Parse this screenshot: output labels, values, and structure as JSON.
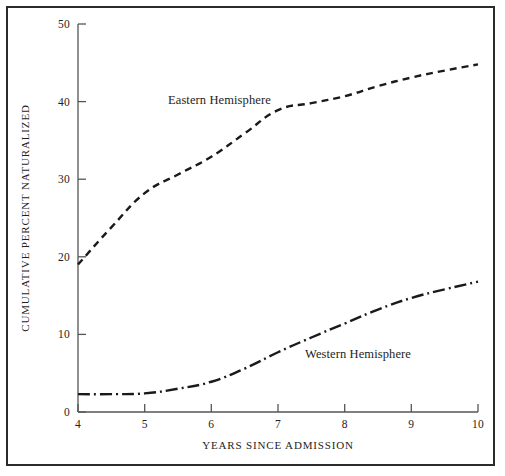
{
  "figure": {
    "background_color": "#ffffff",
    "frame_color": "#2b2b2b",
    "line_color": "#1a1a1a"
  },
  "axes": {
    "x_title": "YEARS SINCE ADMISSION",
    "y_title": "CUMULATIVE PERCENT NATURALIZED",
    "x_ticks": [
      "4",
      "5",
      "6",
      "7",
      "8",
      "9",
      "10"
    ],
    "y_ticks": [
      "0",
      "10",
      "20",
      "30",
      "40",
      "50"
    ]
  },
  "labels": {
    "eastern": "Eastern Hemisphere",
    "western": "Western Hemisphere"
  },
  "chart_data": {
    "type": "line",
    "title": "",
    "subtitle": "",
    "xlabel": "YEARS SINCE ADMISSION",
    "ylabel": "CUMULATIVE PERCENT NATURALIZED",
    "xlim": [
      4,
      10
    ],
    "ylim": [
      0,
      50
    ],
    "x_ticks": [
      4,
      5,
      6,
      7,
      8,
      9,
      10
    ],
    "y_ticks": [
      0,
      10,
      20,
      30,
      40,
      50
    ],
    "grid": false,
    "legend": "inline annotations next to each curve",
    "x": [
      4,
      4.5,
      5,
      5.5,
      6,
      6.5,
      7,
      7.5,
      8,
      8.5,
      9,
      9.5,
      10
    ],
    "series": [
      {
        "name": "Eastern Hemisphere",
        "linestyle": "dashed",
        "values": [
          19.0,
          23.8,
          28.2,
          30.6,
          32.9,
          35.9,
          38.9,
          39.8,
          40.7,
          42.0,
          43.1,
          44.0,
          44.8
        ]
      },
      {
        "name": "Western Hemisphere",
        "linestyle": "dash-dot",
        "values": [
          2.3,
          2.3,
          2.4,
          3.0,
          3.9,
          5.6,
          7.7,
          9.6,
          11.4,
          13.2,
          14.7,
          15.8,
          16.8
        ]
      }
    ],
    "annotations": [
      {
        "text": "Eastern Hemisphere",
        "x": 5.5,
        "y": 41.5
      },
      {
        "text": "Western Hemisphere",
        "x": 7.6,
        "y": 9.6
      }
    ]
  }
}
